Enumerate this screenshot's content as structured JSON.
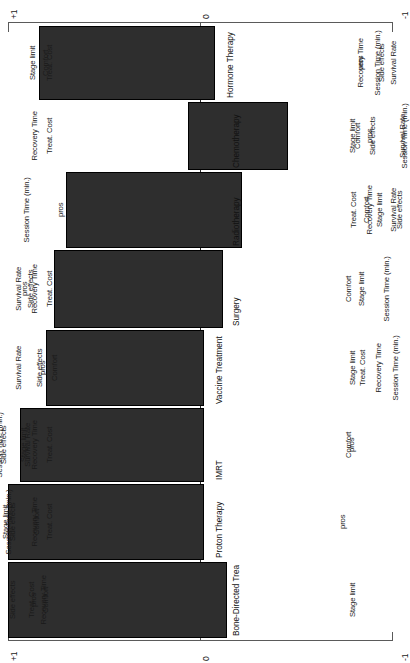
{
  "chart_data": {
    "type": "bar",
    "title": "",
    "subtitle": "",
    "xlabel": "",
    "ylabel": "",
    "orientation": "rotated-90-diverging",
    "grid": false,
    "legend": "none",
    "axis": {
      "ticks": [
        "+1",
        "0",
        "-1"
      ],
      "tick_positions": [
        1,
        0,
        -1
      ],
      "xlim": [
        1,
        -1
      ],
      "zero_reference": 0,
      "top_axis_labels": [
        "+1",
        "0",
        "-1"
      ],
      "bottom_axis_labels": [
        "+1",
        "0",
        "-1"
      ]
    },
    "categories": [
      "Hormone Therapy",
      "Chemotherapy",
      "Radiotherapy",
      "Surgery",
      "Vaccine Treatment",
      "IMRT",
      "Proton Therapy",
      "Bone-Directed Trea"
    ],
    "bars": [
      {
        "label": "Hormone Therapy",
        "low": -0.08,
        "high": 0.84,
        "value": 0.38
      },
      {
        "label": "Chemotherapy",
        "low": -0.46,
        "high": 0.06,
        "value": -0.2
      },
      {
        "label": "Radiotherapy",
        "low": -0.22,
        "high": 0.7,
        "value": 0.24
      },
      {
        "label": "Surgery",
        "low": -0.12,
        "high": 0.76,
        "value": 0.32
      },
      {
        "label": "Vaccine Treatment",
        "low": -0.02,
        "high": 0.8,
        "value": 0.39
      },
      {
        "label": "IMRT",
        "low": -0.02,
        "high": 0.94,
        "value": 0.46
      },
      {
        "label": "Proton Therapy",
        "low": -0.02,
        "high": 1.0,
        "value": 0.49
      },
      {
        "label": "Bone-Directed Trea",
        "low": -0.14,
        "high": 1.0,
        "value": 0.43
      }
    ],
    "rows": [
      {
        "label": "Hormone Therapy",
        "left_attributes": [
          "Stage limit",
          "Comfort",
          "Treat. Cost"
        ],
        "right_attributes": [
          "Recovery Time",
          "Session Time (min.)",
          "pros",
          "Side effects",
          "Survival Rate"
        ]
      },
      {
        "label": "Chemotherapy",
        "left_attributes": [
          "Recovery Time",
          "Treat. Cost"
        ],
        "right_attributes": [
          "Stage limit",
          "Comfort",
          "Side effects",
          "pros",
          "Session Time (min.)",
          "Survival Rate"
        ]
      },
      {
        "label": "Radiotherapy",
        "left_attributes": [
          "Session Time (min.)",
          "pros"
        ],
        "right_attributes": [
          "Treat. Cost",
          "Recovery Time",
          "Comfort",
          "Stage limit",
          "Survival Rate",
          "Side effects"
        ]
      },
      {
        "label": "Surgery",
        "left_attributes": [
          "pros",
          "Survival Rate",
          "Side effects",
          "Recovery Time",
          "Treat. Cost"
        ],
        "right_attributes": [
          "Comfort",
          "Stage limit",
          "Session Time (min.)"
        ]
      },
      {
        "label": "Vaccine Treatment",
        "left_attributes": [
          "Survival Rate",
          "pros",
          "Side effects",
          "Comfort"
        ],
        "right_attributes": [
          "Stage limit",
          "Treat. Cost",
          "Recovery Time",
          "Session Time (min.)"
        ]
      },
      {
        "label": "IMRT",
        "left_attributes": [
          "Side effects",
          "Session Time (min.)",
          "Stage limit",
          "Survival Rate",
          "Recovery Time",
          "Treat. Cost"
        ],
        "right_attributes": [
          "Comfort",
          "pros"
        ]
      },
      {
        "label": "Proton Therapy",
        "left_attributes": [
          "Survival Rate",
          "Stage limit",
          "Side effects",
          "Session Time (min.)",
          "Comfort",
          "Recovery Time",
          "Treat. Cost"
        ],
        "right_attributes": [
          "pros"
        ]
      },
      {
        "label": "Bone-Directed Trea",
        "left_attributes": [
          "Survival Rate",
          "Session Time (min.)",
          "Side effects",
          "pros",
          "Treat. Cost",
          "Comfort",
          "Recovery Time"
        ],
        "right_attributes": [
          "Stage limit"
        ]
      }
    ],
    "colors": {
      "bar_fill": "#2e2e2e",
      "bar_stroke": "#000000",
      "axis": "#5a5a5a",
      "baseline": "#2b2b2b",
      "text": "#1a1a1a",
      "background": "#ffffff"
    }
  },
  "geometry": {
    "zero_x": 200,
    "px_per_unit": 192,
    "row_tops": [
      26,
      102,
      172,
      250,
      330,
      408,
      484,
      562
    ],
    "row_heights": [
      74,
      68,
      76,
      78,
      76,
      74,
      76,
      76
    ],
    "label_left_x": 68,
    "label_right_x": 336
  }
}
